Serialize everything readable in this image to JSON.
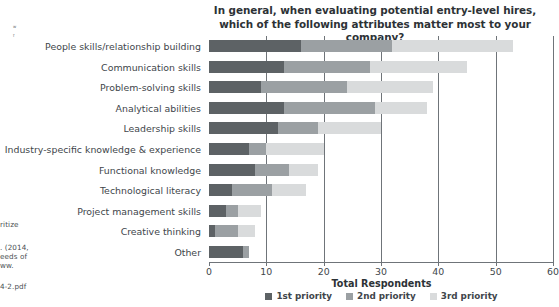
{
  "chart_data": {
    "type": "bar",
    "orientation": "horizontal",
    "stacked": true,
    "title": "In general, when evaluating potential entry-level hires, which of the following attributes matter most to your company?",
    "xlabel": "Total Respondents",
    "ylabel": "",
    "xlim": [
      0,
      60
    ],
    "xticks": [
      0,
      10,
      20,
      30,
      40,
      50,
      60
    ],
    "grid": true,
    "legend_position": "bottom",
    "categories": [
      "People skills/relationship building",
      "Communication skills",
      "Problem-solving skills",
      "Analytical abilities",
      "Leadership skills",
      "Industry-specific knowledge & experience",
      "Functional knowledge",
      "Technological literacy",
      "Project management skills",
      "Creative thinking",
      "Other"
    ],
    "series": [
      {
        "name": "1st priority",
        "color": "#5d6265",
        "values": [
          16,
          13,
          9,
          13,
          12,
          7,
          8,
          4,
          3,
          1,
          6
        ]
      },
      {
        "name": "2nd priority",
        "color": "#9ba0a3",
        "values": [
          16,
          15,
          15,
          16,
          7,
          3,
          6,
          7,
          2,
          4,
          1
        ]
      },
      {
        "name": "3rd priority",
        "color": "#d9dbdc",
        "values": [
          21,
          17,
          15,
          9,
          11,
          10,
          5,
          6,
          4,
          3,
          0
        ]
      }
    ],
    "totals": [
      53,
      45,
      39,
      38,
      30,
      20,
      19,
      17,
      9,
      8,
      7
    ]
  },
  "legend": [
    {
      "label": "1st priority",
      "color": "#5d6265"
    },
    {
      "label": "2nd priority",
      "color": "#9ba0a3"
    },
    {
      "label": "3rd priority",
      "color": "#d9dbdc"
    }
  ],
  "margin_notes": {
    "line_1": "ritize",
    "line_2": ". (2014,",
    "line_3": "eeds of",
    "line_4": "ww.",
    "line_5": "4-2.pdf",
    "tiny_1": "w",
    "tiny_2": "f"
  }
}
